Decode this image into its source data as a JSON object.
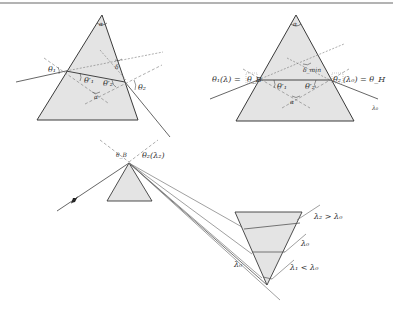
{
  "figure": {
    "type": "prism refraction diagram",
    "colors": {
      "prism_fill": "#e4e4e4",
      "prism_edge": "#3a3a3a",
      "ray": "#555555",
      "normal_dashed": "#777777",
      "top_rule": "#9a9a9a"
    },
    "panel_a": {
      "apex_label": "α",
      "labels": {
        "theta1": "θ₁",
        "theta1p": "θ′₁",
        "theta2p": "θ′₂",
        "theta2": "θ₂",
        "delta": "δ",
        "alpha_inner": "α"
      }
    },
    "panel_b": {
      "apex_label": "α",
      "labels": {
        "left": "θ₁(λ) = θ_B",
        "left_main": "θ₁(λ) =",
        "left_box": "θ_B",
        "right_box": "θ₂",
        "right_main": "(λ₀) = θ_H",
        "theta1p": "θ′₁",
        "theta2p": "θ′₂",
        "delta_min": "δ_min",
        "alpha_inner": "α",
        "out_ray": "λ₀"
      }
    },
    "panel_c": {
      "labels": {
        "theta_B": "θ_B",
        "theta2_l2": "θ₂(λ₂)",
        "l2_gt": "λ₂ > λ₀",
        "l0": "λ₀",
        "l1_lt": "λ₁ < λ₀",
        "lB": "λ₀"
      }
    }
  }
}
